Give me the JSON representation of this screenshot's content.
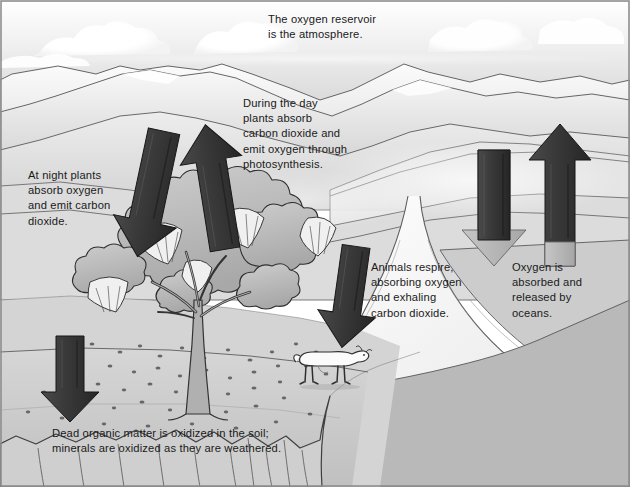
{
  "diagram": {
    "palette": {
      "sky": "#d8d8d8",
      "cloud": "#ffffff",
      "mountain_light": "#f2f2f2",
      "mountain_mid": "#cfcfcf",
      "ground": "#c9c9c9",
      "water": "#f4f4f4",
      "arrow_dark": "#3a3a3a",
      "arrow_light": "#b5b5b5",
      "ink": "#1a1a1a",
      "frame": "#8a8a8a"
    },
    "captions": [
      {
        "id": "reservoir",
        "text": "The oxygen reservoir\nis the atmosphere."
      },
      {
        "id": "day",
        "text": "During the day\nplants absorb\ncarbon dioxide and\nemit oxygen through\nphotosynthesis."
      },
      {
        "id": "night",
        "text": "At night plants\nabsorb oxygen\nand emit carbon\ndioxide."
      },
      {
        "id": "animals",
        "text": "Animals respire,\nabsorbing oxygen\nand exhaling\ncarbon dioxide."
      },
      {
        "id": "oceans",
        "text": "Oxygen is\nabsorbed and\nreleased by\noceans."
      },
      {
        "id": "soil",
        "text": "Dead organic matter is oxidized in the soil;\nminerals are oxidized as they are weathered."
      }
    ],
    "arrows": [
      {
        "id": "night-down",
        "direction": "down",
        "shade": "dark",
        "meaning": "plants absorb oxygen at night"
      },
      {
        "id": "day-up",
        "direction": "up",
        "shade": "dark",
        "meaning": "plants emit oxygen by day"
      },
      {
        "id": "animals-down",
        "direction": "down",
        "shade": "dark",
        "meaning": "animals absorb oxygen"
      },
      {
        "id": "ocean-down",
        "direction": "down",
        "shade": "mixed",
        "meaning": "oxygen absorbed by oceans"
      },
      {
        "id": "ocean-up",
        "direction": "up",
        "shade": "dark",
        "meaning": "oxygen released by oceans"
      },
      {
        "id": "soil-down",
        "direction": "down",
        "shade": "dark",
        "meaning": "oxidation in the soil"
      }
    ],
    "scene_objects": [
      {
        "id": "sky",
        "label": "sky"
      },
      {
        "id": "clouds",
        "label": "clouds"
      },
      {
        "id": "mountains",
        "label": "mountain range"
      },
      {
        "id": "hills",
        "label": "rolling hills"
      },
      {
        "id": "tree",
        "label": "deciduous tree"
      },
      {
        "id": "leaflitter",
        "label": "fallen leaves"
      },
      {
        "id": "goat",
        "label": "grazing goat"
      },
      {
        "id": "river",
        "label": "river and estuary"
      },
      {
        "id": "cliff",
        "label": "eroded cliff bank"
      }
    ]
  }
}
